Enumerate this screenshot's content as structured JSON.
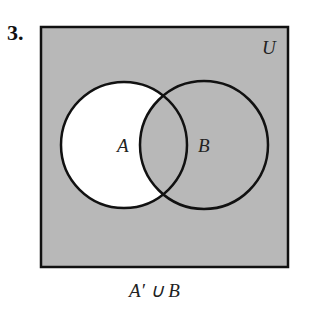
{
  "problem_number": "3.",
  "diagram": {
    "universe_label": "U",
    "set_a_label": "A",
    "set_b_label": "B",
    "shaded_region": "A' ∪ B",
    "colors": {
      "shade": "#b8b8b8",
      "unshaded": "#ffffff",
      "stroke": "#111111"
    }
  },
  "caption": "A′ ∪ B"
}
